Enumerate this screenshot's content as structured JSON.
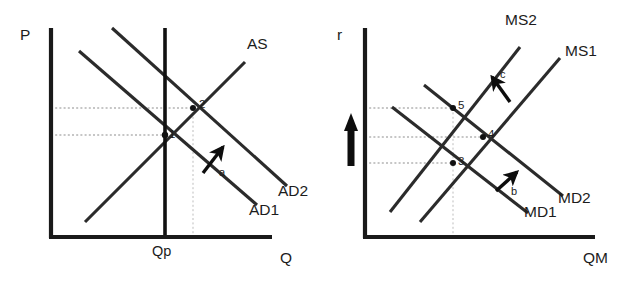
{
  "figure": {
    "type": "diagram",
    "panel_count": 2,
    "colors": {
      "ink": "#1c1c1c",
      "curve": "#2b2b2b",
      "guide": "#8d8d8d",
      "background": "#ffffff"
    }
  },
  "left_panel": {
    "name": "goods-market",
    "axes": {
      "y_label": "P",
      "x_label": "Q",
      "y_axis_x": 51,
      "x_axis_y": 237
    },
    "tick_labels": [
      {
        "text": "Qp",
        "x": 157,
        "y": 242
      }
    ],
    "potential_output_line": {
      "label": "Qp",
      "x": 165,
      "y_top": 28,
      "y_bottom": 237
    },
    "curves": [
      {
        "label": "AS",
        "slope": "upward",
        "x1": 85,
        "y1": 222,
        "x2": 245,
        "y2": 62,
        "label_x": 249,
        "label_y": 43
      },
      {
        "label": "AD1",
        "slope": "downward",
        "x1": 79,
        "y1": 51,
        "x2": 257,
        "y2": 205,
        "label_x": 252,
        "label_y": 202
      },
      {
        "label": "AD2",
        "slope": "downward",
        "x1": 112,
        "y1": 28,
        "x2": 287,
        "y2": 186,
        "label_x": 282,
        "label_y": 183
      }
    ],
    "equilibrium_points": [
      {
        "label": "1",
        "x": 165,
        "y": 135,
        "label_x": 169,
        "label_y": 128
      },
      {
        "label": "2",
        "x": 193,
        "y": 108,
        "label_x": 198,
        "label_y": 97
      }
    ],
    "guide_lines": {
      "horizontal": [
        {
          "from_x": 51,
          "to_x": 165,
          "y": 135
        },
        {
          "from_x": 51,
          "to_x": 193,
          "y": 108
        }
      ],
      "vertical": [
        {
          "x": 193,
          "from_y": 108,
          "to_y": 237
        }
      ]
    },
    "shift_arrows": [
      {
        "label": "a",
        "x1": 203,
        "y1": 173,
        "x2": 223,
        "y2": 147,
        "label_x": 220,
        "label_y": 169
      }
    ]
  },
  "right_panel": {
    "name": "money-market",
    "axes": {
      "y_label": "r",
      "x_label": "QM",
      "y_axis_x": 365,
      "x_axis_y": 237
    },
    "curves": [
      {
        "label": "MS2",
        "slope": "upward",
        "x1": 390,
        "y1": 212,
        "x2": 520,
        "y2": 47,
        "label_x": 508,
        "label_y": 13
      },
      {
        "label": "MS1",
        "slope": "upward",
        "x1": 420,
        "y1": 222,
        "x2": 560,
        "y2": 58,
        "label_x": 566,
        "label_y": 44
      },
      {
        "label": "MD1",
        "slope": "downward",
        "x1": 392,
        "y1": 107,
        "x2": 528,
        "y2": 213,
        "label_x": 528,
        "label_y": 205
      },
      {
        "label": "MD2",
        "slope": "downward",
        "x1": 424,
        "y1": 85,
        "x2": 563,
        "y2": 196,
        "label_x": 563,
        "label_y": 192
      }
    ],
    "equilibrium_points": [
      {
        "label": "3",
        "x": 453,
        "y": 163,
        "label_x": 458,
        "label_y": 155
      },
      {
        "label": "4",
        "x": 483,
        "y": 137,
        "label_x": 488,
        "label_y": 127
      },
      {
        "label": "5",
        "x": 453,
        "y": 108,
        "label_x": 458,
        "label_y": 97
      }
    ],
    "guide_lines": {
      "horizontal": [
        {
          "from_x": 365,
          "to_x": 453,
          "y": 108
        },
        {
          "from_x": 365,
          "to_x": 483,
          "y": 137
        },
        {
          "from_x": 365,
          "to_x": 453,
          "y": 163
        }
      ],
      "vertical": [
        {
          "x": 453,
          "from_y": 108,
          "to_y": 237
        }
      ]
    },
    "shift_arrows": [
      {
        "label": "b",
        "x1": 496,
        "y1": 191,
        "x2": 516,
        "y2": 172,
        "label_x": 512,
        "label_y": 188
      },
      {
        "label": "c",
        "x1": 509,
        "y1": 101,
        "x2": 492,
        "y2": 77,
        "label_x": 501,
        "label_y": 72
      }
    ],
    "rate_increase_arrow": {
      "name": "interest-rate-increase-arrow",
      "direction": "up",
      "x": 351,
      "y_tail": 166,
      "y_head": 114
    }
  }
}
